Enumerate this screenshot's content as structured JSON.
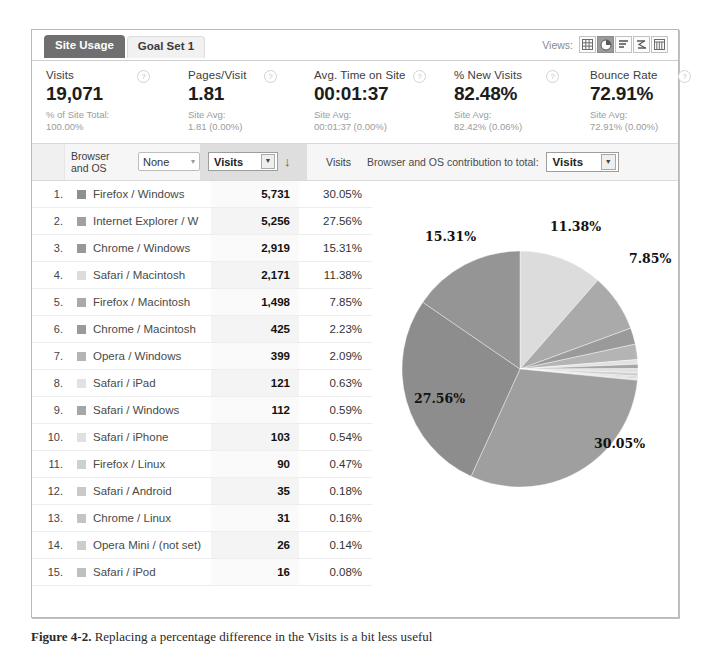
{
  "tabs": [
    {
      "label": "Site Usage",
      "active": true
    },
    {
      "label": "Goal Set 1",
      "active": false
    }
  ],
  "views": {
    "label": "Views:",
    "icons": [
      {
        "name": "table-view-icon",
        "selected": false
      },
      {
        "name": "pie-chart-view-icon",
        "selected": true
      },
      {
        "name": "performance-view-icon",
        "selected": false
      },
      {
        "name": "comparison-view-icon",
        "selected": false
      },
      {
        "name": "pivot-view-icon",
        "selected": false
      }
    ]
  },
  "metrics": [
    {
      "name": "Visits",
      "value": "19,071",
      "sub_label": "% of Site Total:",
      "sub_value": "100.00%",
      "help": "?"
    },
    {
      "name": "Pages/Visit",
      "value": "1.81",
      "sub_label": "Site Avg:",
      "sub_value": "1.81 (0.00%)",
      "help": "?"
    },
    {
      "name": "Avg. Time on Site",
      "value": "00:01:37",
      "sub_label": "Site Avg:",
      "sub_value": "00:01:37 (0.00%)",
      "help": "?"
    },
    {
      "name": "% New Visits",
      "value": "82.48%",
      "sub_label": "Site Avg:",
      "sub_value": "82.42% (0.06%)",
      "help": "?"
    },
    {
      "name": "Bounce Rate",
      "value": "72.91%",
      "sub_label": "Site Avg:",
      "sub_value": "72.91% (0.00%)",
      "help": "?"
    }
  ],
  "controls": {
    "dimension_label_line1": "Browser",
    "dimension_label_line2": "and OS",
    "secondary_dimension": "None",
    "sort_metric": "Visits",
    "sort_direction": "↓",
    "value_column_header": "Visits",
    "contribution_label": "Browser and OS contribution to total:",
    "contribution_metric": "Visits"
  },
  "table": {
    "rows": [
      {
        "rank": "1.",
        "label": "Firefox / Windows",
        "visits": "5,731",
        "pct": "30.05%",
        "swatch": "#8f8f8f"
      },
      {
        "rank": "2.",
        "label": "Internet Explorer / W",
        "visits": "5,256",
        "pct": "27.56%",
        "swatch": "#a0a0a0"
      },
      {
        "rank": "3.",
        "label": "Chrome / Windows",
        "visits": "2,919",
        "pct": "15.31%",
        "swatch": "#989898"
      },
      {
        "rank": "4.",
        "label": "Safari / Macintosh",
        "visits": "2,171",
        "pct": "11.38%",
        "swatch": "#dcdcdc"
      },
      {
        "rank": "5.",
        "label": "Firefox / Macintosh",
        "visits": "1,498",
        "pct": "7.85%",
        "swatch": "#aaaaaa"
      },
      {
        "rank": "6.",
        "label": "Chrome / Macintosh",
        "visits": "425",
        "pct": "2.23%",
        "swatch": "#9a9a9a"
      },
      {
        "rank": "7.",
        "label": "Opera / Windows",
        "visits": "399",
        "pct": "2.09%",
        "swatch": "#b4b4b4"
      },
      {
        "rank": "8.",
        "label": "Safari / iPad",
        "visits": "121",
        "pct": "0.63%",
        "swatch": "#e2e2e2"
      },
      {
        "rank": "9.",
        "label": "Safari / Windows",
        "visits": "112",
        "pct": "0.59%",
        "swatch": "#a6a6a6"
      },
      {
        "rank": "10.",
        "label": "Safari / iPhone",
        "visits": "103",
        "pct": "0.54%",
        "swatch": "#e0e0e0"
      },
      {
        "rank": "11.",
        "label": "Firefox / Linux",
        "visits": "90",
        "pct": "0.47%",
        "swatch": "#cfcfcf"
      },
      {
        "rank": "12.",
        "label": "Safari / Android",
        "visits": "35",
        "pct": "0.18%",
        "swatch": "#c9c9c9"
      },
      {
        "rank": "13.",
        "label": "Chrome / Linux",
        "visits": "31",
        "pct": "0.16%",
        "swatch": "#c4c4c4"
      },
      {
        "rank": "14.",
        "label": "Opera Mini / (not set)",
        "visits": "26",
        "pct": "0.14%",
        "swatch": "#cccccc"
      },
      {
        "rank": "15.",
        "label": "Safari / iPod",
        "visits": "16",
        "pct": "0.08%",
        "swatch": "#bfbfbf"
      }
    ]
  },
  "chart_data": {
    "type": "pie",
    "title": "",
    "start_angle_deg": 0,
    "direction": "clockwise",
    "labels_shown": [
      "11.38%",
      "7.85%",
      "30.05%",
      "27.56%",
      "15.31%"
    ],
    "categories": [
      "Safari / Macintosh",
      "Firefox / Macintosh",
      "Chrome / Macintosh",
      "Opera / Windows",
      "Safari / iPad",
      "Safari / Windows",
      "Safari / iPhone",
      "Firefox / Linux",
      "Safari / Android",
      "Chrome / Linux",
      "Opera Mini / (not set)",
      "Safari / iPod",
      "Firefox / Windows",
      "Internet Explorer / W",
      "Chrome / Windows"
    ],
    "values": [
      11.38,
      7.85,
      2.23,
      2.09,
      0.63,
      0.59,
      0.54,
      0.47,
      0.18,
      0.16,
      0.14,
      0.08,
      30.05,
      27.56,
      15.31
    ],
    "colors": [
      "#dcdcdc",
      "#aaaaaa",
      "#9a9a9a",
      "#b4b4b4",
      "#e2e2e2",
      "#a6a6a6",
      "#e0e0e0",
      "#cfcfcf",
      "#c9c9c9",
      "#c4c4c4",
      "#cccccc",
      "#bfbfbf",
      "#9f9f9f",
      "#8d8d8d",
      "#959595"
    ],
    "annotations": [
      {
        "text": "11.38%",
        "x": 550,
        "y": 214
      },
      {
        "text": "7.85%",
        "x": 629,
        "y": 246
      },
      {
        "text": "15.31%",
        "x": 425,
        "y": 224
      },
      {
        "text": "27.56%",
        "x": 414,
        "y": 386
      },
      {
        "text": "30.05%",
        "x": 594,
        "y": 431
      }
    ]
  },
  "caption": {
    "figure_label": "Figure 4-2.",
    "text": " Replacing a percentage difference in the Visits is a bit less useful"
  }
}
